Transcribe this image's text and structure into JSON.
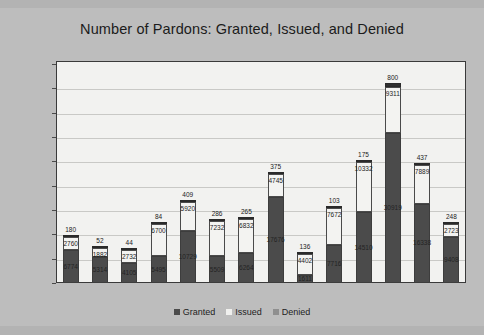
{
  "chart_data": {
    "type": "bar",
    "subtype": "stacked-bar",
    "title": "Number of Pardons: Granted, Issued, and Denied",
    "xlabel": "",
    "ylabel": "",
    "ylim": [
      0,
      45000
    ],
    "ytick_labels": [
      "0",
      "5000",
      "10000",
      "15000",
      "20000",
      "25000",
      "30000",
      "35000",
      "40000",
      "45000"
    ],
    "ytick_values": [
      0,
      5000,
      10000,
      15000,
      20000,
      25000,
      30000,
      35000,
      40000,
      45000
    ],
    "grid": true,
    "legend_position": "bottom",
    "categories": [
      "1998",
      "1999",
      "2000",
      "2001",
      "2002",
      "2003",
      "2004",
      "2005",
      "2006",
      "2007",
      "2008",
      "2009",
      "2010",
      "2011"
    ],
    "series": [
      {
        "name": "Granted",
        "color": "#4b4b4b",
        "values": [
          6774,
          5314,
          4105,
          5495,
          10729,
          5509,
          6264,
          17676,
          1611,
          7716,
          14510,
          30919,
          16338,
          9408
        ]
      },
      {
        "name": "Issued",
        "color": "#f3f3f1",
        "values": [
          2760,
          1882,
          2732,
          6700,
          5920,
          7232,
          6832,
          4745,
          4402,
          7672,
          10332,
          9311,
          7889,
          2723
        ]
      },
      {
        "name": "Denied",
        "color": "#2f2f2f",
        "values": [
          180,
          52,
          44,
          84,
          409,
          286,
          265,
          375,
          136,
          103,
          175,
          800,
          437,
          248
        ]
      }
    ]
  },
  "legend": {
    "items": [
      {
        "label": "Granted",
        "swatch": "granted-swatch"
      },
      {
        "label": "Issued",
        "swatch": "issued-swatch"
      },
      {
        "label": "Denied",
        "swatch": "denied-swatch"
      }
    ]
  }
}
